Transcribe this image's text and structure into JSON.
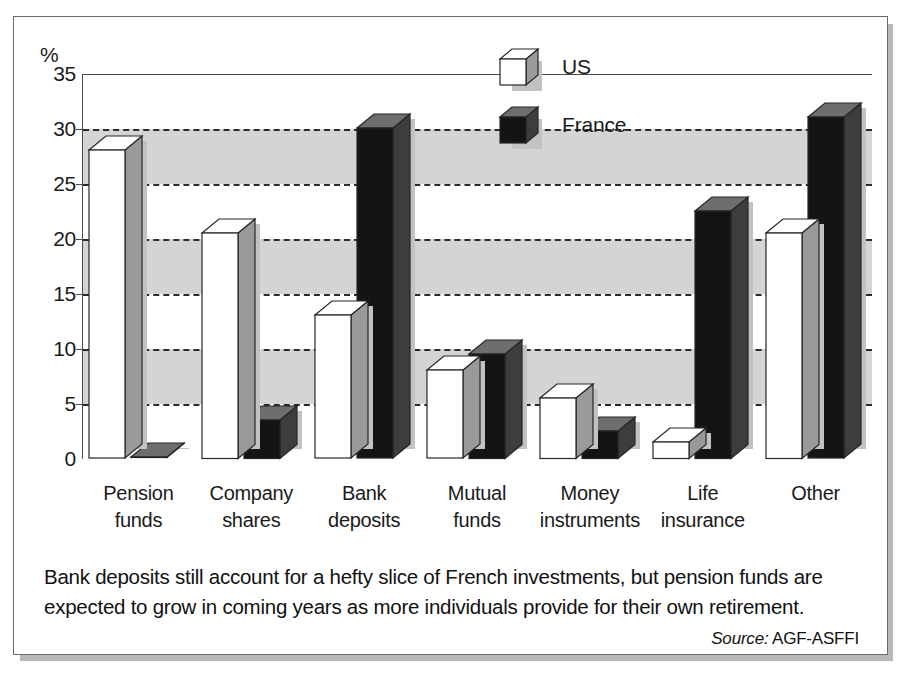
{
  "figure": {
    "y_axis_unit": "%",
    "caption": "Bank deposits still account for a hefty slice of French investments, but pension funds are expected to grow in coming years as more individuals provide for their own retirement.",
    "source_word": "Source:",
    "source_value": "AGF-ASFFI"
  },
  "legend": {
    "items": [
      {
        "label": "US",
        "swatch": "white-cube-icon",
        "color": "#ffffff"
      },
      {
        "label": "France",
        "swatch": "black-cube-icon",
        "color": "#141414"
      }
    ]
  },
  "chart_data": {
    "type": "bar",
    "title": "",
    "xlabel": "",
    "ylabel": "%",
    "ylim": [
      0,
      35
    ],
    "yticks": [
      0,
      5,
      10,
      15,
      20,
      25,
      30,
      35
    ],
    "ytick_labels": [
      "0",
      "5",
      "10",
      "15",
      "20",
      "25",
      "30",
      "35"
    ],
    "grid": true,
    "grid_style": "dashed horizontal gridlines at 5,10,15,20,25,30",
    "shaded_bands": [
      [
        5,
        10
      ],
      [
        15,
        20
      ],
      [
        25,
        30
      ]
    ],
    "legend_position": "top-center",
    "style": "3d-columns",
    "categories": [
      "Pension\nfunds",
      "Company\nshares",
      "Bank\ndeposits",
      "Mutual\nfunds",
      "Money\ninstruments",
      "Life\ninsurance",
      "Other"
    ],
    "category_labels": [
      {
        "line1": "Pension",
        "line2": "funds"
      },
      {
        "line1": "Company",
        "line2": "shares"
      },
      {
        "line1": "Bank",
        "line2": "deposits"
      },
      {
        "line1": "Mutual",
        "line2": "funds"
      },
      {
        "line1": "Money",
        "line2": "instruments"
      },
      {
        "line1": "Life",
        "line2": "insurance"
      },
      {
        "line1": "Other",
        "line2": ""
      }
    ],
    "series": [
      {
        "name": "US",
        "color": "#ffffff",
        "values": [
          28,
          20.5,
          13,
          8,
          5.5,
          1.5,
          20.5
        ]
      },
      {
        "name": "France",
        "color": "#141414",
        "values": [
          0,
          3.5,
          30,
          9.5,
          2.5,
          22.5,
          31
        ]
      }
    ]
  }
}
